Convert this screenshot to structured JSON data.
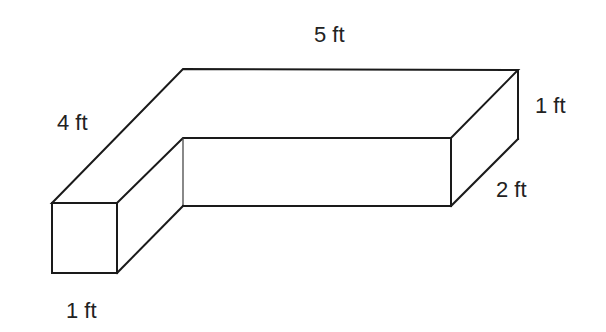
{
  "figure": {
    "labels": {
      "top_length": "5 ft",
      "left_length": "4 ft",
      "height": "1 ft",
      "right_depth": "2 ft",
      "front_width": "1 ft"
    },
    "colors": {
      "line": "#1a1a1a",
      "text": "#222222",
      "background": "#ffffff"
    }
  }
}
